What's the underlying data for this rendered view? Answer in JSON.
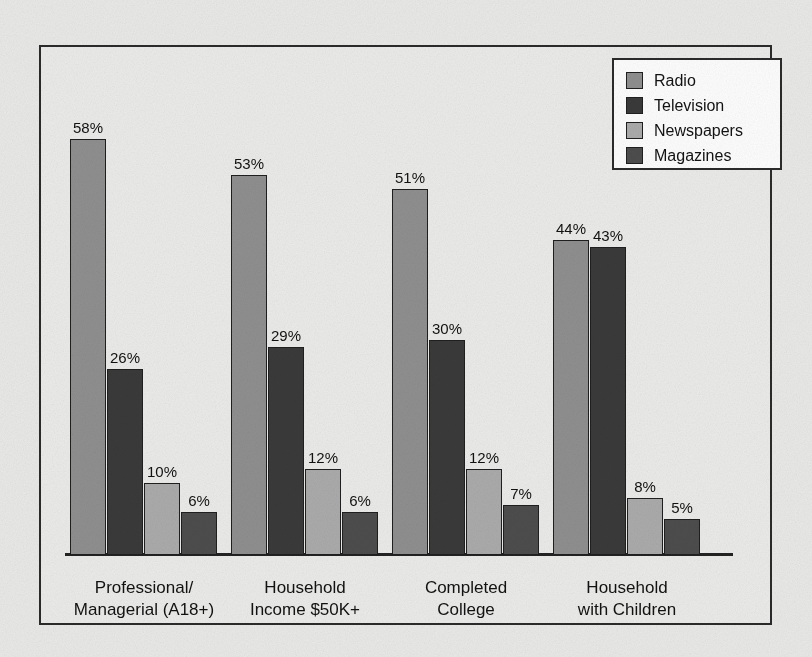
{
  "chart_data": {
    "type": "bar",
    "title": "",
    "subtitle": "",
    "xlabel": "",
    "ylabel": "",
    "ylim": [
      0,
      60
    ],
    "grid": false,
    "legend_position": "top-right",
    "value_suffix": "%",
    "categories": [
      "Professional/\nManagerial (A18+)",
      "Household\nIncome $50K+",
      "Completed\nCollege",
      "Household\nwith Children"
    ],
    "series": [
      {
        "name": "Radio",
        "color": "#8f8f8f",
        "values": [
          58,
          53,
          51,
          44
        ]
      },
      {
        "name": "Television",
        "color": "#3a3a3a",
        "values": [
          26,
          29,
          30,
          43
        ]
      },
      {
        "name": "Newspapers",
        "color": "#ababab",
        "values": [
          10,
          12,
          12,
          8
        ]
      },
      {
        "name": "Magazines",
        "color": "#4d4d4d",
        "values": [
          6,
          6,
          7,
          5
        ]
      }
    ],
    "data_labels": [
      [
        "58%",
        "26%",
        "10%",
        "6%"
      ],
      [
        "53%",
        "29%",
        "12%",
        "6%"
      ],
      [
        "51%",
        "30%",
        "12%",
        "7%"
      ],
      [
        "44%",
        "43%",
        "8%",
        "5%"
      ]
    ]
  },
  "legend": {
    "entries": [
      {
        "label": "Radio",
        "color": "#8f8f8f"
      },
      {
        "label": "Television",
        "color": "#3a3a3a"
      },
      {
        "label": "Newspapers",
        "color": "#ababab"
      },
      {
        "label": "Magazines",
        "color": "#4d4d4d"
      }
    ]
  },
  "style": {
    "paper_color": "#e9e9e7",
    "frame_color": "#2b2b2b",
    "axis_color": "#232323",
    "text_color": "#121212",
    "legend_background": "#fdfdfd"
  }
}
